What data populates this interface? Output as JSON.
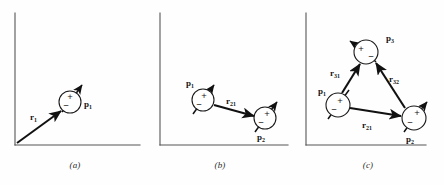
{
  "figure": {
    "background_color": "#fefefe",
    "ink_color": "#111111",
    "axis_color": "#555555"
  },
  "panels": [
    {
      "id": "a",
      "caption": "(a)",
      "axes": {
        "origin_label": "",
        "has_x_axis": true,
        "has_y_axis": true
      },
      "dipoles": [
        {
          "name": "dipole-1",
          "label": "p",
          "subscript": "1",
          "plus_sign": "+",
          "minus_sign": "−",
          "cx": 70,
          "cy": 102,
          "r": 11,
          "axis_angle_deg": -62
        }
      ],
      "vectors": [
        {
          "name": "position-vector-r1",
          "label": "r",
          "subscript": "1",
          "from": "origin",
          "to": "dipole-1",
          "x1": 17,
          "y1": 143,
          "x2": 61,
          "y2": 111,
          "label_x": 30,
          "label_y": 116
        }
      ]
    },
    {
      "id": "b",
      "caption": "(b)",
      "axes": {
        "origin_label": "",
        "has_x_axis": true,
        "has_y_axis": true
      },
      "dipoles": [
        {
          "name": "dipole-1",
          "label": "p",
          "subscript": "1",
          "plus_sign": "+",
          "minus_sign": "−",
          "cx": 57,
          "cy": 100,
          "r": 11,
          "axis_angle_deg": -60
        },
        {
          "name": "dipole-2",
          "label": "p",
          "subscript": "2",
          "plus_sign": "+",
          "minus_sign": "−",
          "cx": 119,
          "cy": 118,
          "r": 11,
          "axis_angle_deg": -60
        }
      ],
      "vectors": [
        {
          "name": "separation-vector-r21",
          "label": "r",
          "subscript": "21",
          "from": "dipole-1",
          "to": "dipole-2",
          "x1": 68,
          "y1": 105,
          "x2": 108,
          "y2": 116,
          "label_x": 81,
          "label_y": 103
        }
      ]
    },
    {
      "id": "c",
      "caption": "(c)",
      "axes": {
        "origin_label": "",
        "has_x_axis": true,
        "has_y_axis": true
      },
      "dipoles": [
        {
          "name": "dipole-3",
          "label": "p",
          "subscript": "3",
          "plus_sign": "+",
          "minus_sign": "−",
          "cx": 74,
          "cy": 52,
          "r": 12,
          "axis_angle_deg": -145
        },
        {
          "name": "dipole-1",
          "label": "p",
          "subscript": "1",
          "plus_sign": "+",
          "minus_sign": "−",
          "cx": 46,
          "cy": 105,
          "r": 12,
          "axis_angle_deg": -60
        },
        {
          "name": "dipole-2",
          "label": "p",
          "subscript": "2",
          "plus_sign": "+",
          "minus_sign": "−",
          "cx": 122,
          "cy": 118,
          "r": 12,
          "axis_angle_deg": -60
        }
      ],
      "vectors": [
        {
          "name": "separation-vector-r31",
          "label": "r",
          "subscript": "31",
          "from": "dipole-1",
          "to": "dipole-3",
          "x1": 66,
          "y1": 64,
          "x2": 50,
          "y2": 93,
          "label_x": 46,
          "label_y": 72
        },
        {
          "name": "separation-vector-r32",
          "label": "r",
          "subscript": "32",
          "from": "dipole-2",
          "to": "dipole-3",
          "x1": 113,
          "y1": 108,
          "x2": 83,
          "y2": 63,
          "label_x": 101,
          "label_y": 78
        },
        {
          "name": "separation-vector-r21",
          "label": "r",
          "subscript": "21",
          "from": "dipole-1",
          "to": "dipole-2",
          "x1": 58,
          "y1": 107,
          "x2": 110,
          "y2": 116,
          "label_x": 74,
          "label_y": 124
        }
      ]
    }
  ]
}
